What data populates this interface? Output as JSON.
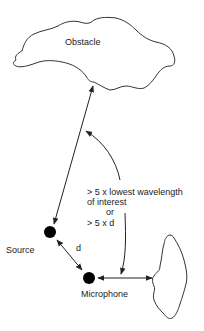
{
  "diagram": {
    "nodes": {
      "obstacle": {
        "label": "Obstacle"
      },
      "source": {
        "label": "Source"
      },
      "microphone": {
        "label": "Microphone"
      },
      "wall_obstacle": {
        "label": ""
      }
    },
    "edges": {
      "source_to_obstacle": {
        "label": "",
        "bidirectional": true
      },
      "source_to_microphone": {
        "label": "d",
        "bidirectional": true
      },
      "microphone_to_wall": {
        "label": "",
        "bidirectional": true
      }
    },
    "annotation": {
      "line1": "> 5 x lowest wavelength",
      "line2": "of interest",
      "line3": "or",
      "line4": "> 5 x d"
    },
    "colors": {
      "stroke": "#333333",
      "fill_dot": "#000000",
      "text": "#222222"
    }
  }
}
